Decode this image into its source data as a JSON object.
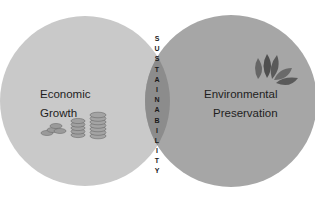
{
  "diagram": {
    "type": "venn",
    "left_circle": {
      "label_line1": "Economic",
      "label_line2": "Growth",
      "icon": "coins-icon",
      "fill": "#c9c9c9"
    },
    "right_circle": {
      "label_line1": "Environmental",
      "label_line2": "Preservation",
      "icon": "leaves-icon",
      "fill": "#a8a8a8"
    },
    "intersection": {
      "label": "SUSTAINABILITY",
      "letters": [
        "S",
        "U",
        "S",
        "T",
        "A",
        "I",
        "N",
        "A",
        "B",
        "I",
        "L",
        "I",
        "T",
        "Y"
      ],
      "fill": "#8a8a8a"
    }
  }
}
